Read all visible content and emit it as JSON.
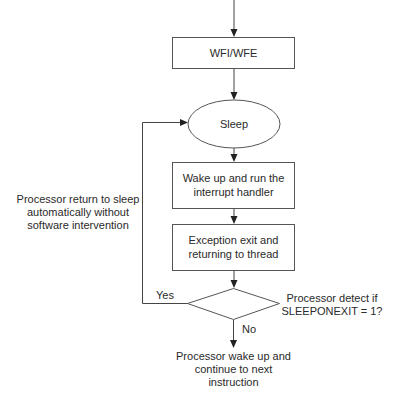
{
  "flowchart": {
    "nodes": {
      "wfi": {
        "label": "WFI/WFE",
        "shape": "rectangle"
      },
      "sleep": {
        "label": "Sleep",
        "shape": "ellipse"
      },
      "wake": {
        "lines": [
          "Wake up and run the",
          "interrupt handler"
        ],
        "shape": "rectangle"
      },
      "exit": {
        "lines": [
          "Exception exit and",
          "returning to thread"
        ],
        "shape": "rectangle"
      },
      "decision": {
        "lines": [
          "Processor detect if",
          "SLEEPONEXIT = 1?"
        ],
        "shape": "diamond"
      },
      "end": {
        "lines": [
          "Processor wake up and",
          "continue to next",
          "instruction"
        ],
        "shape": "text"
      }
    },
    "edges": {
      "yes_label": "Yes",
      "no_label": "No",
      "loop_note": [
        "Processor return to sleep",
        "automatically without",
        "software intervention"
      ]
    },
    "colors": {
      "stroke": "#555555",
      "text": "#2a2a2a",
      "background": "#ffffff"
    }
  }
}
